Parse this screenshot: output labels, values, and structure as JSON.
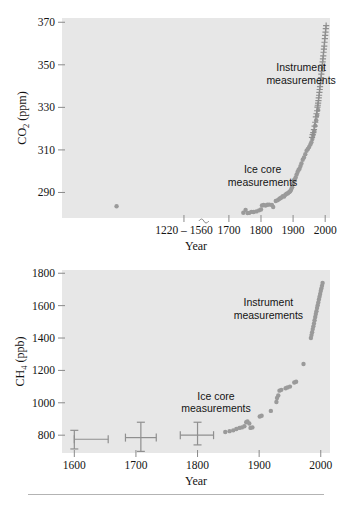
{
  "figure": {
    "background_color": "#ffffff",
    "plot_background_color": "#e7e7e7",
    "marker_color": "#9a9a9a",
    "axis_color": "#8a8a8a",
    "text_color": "#141414"
  },
  "chart_data": [
    {
      "id": "co2",
      "type": "scatter",
      "title": "",
      "xlabel": "Year",
      "ylabel": "CO2 (ppm)",
      "ylabel_parts": {
        "base": "CO",
        "sub": "2",
        "unit": "(ppm)"
      },
      "xlim": [
        1180,
        2015
      ],
      "ylim": [
        278,
        372
      ],
      "grid": false,
      "legend_position": "none",
      "x_ticks": [
        1560,
        1700,
        1800,
        1900,
        2000
      ],
      "x_tick_labels": [
        "1220 – 1560",
        "1700",
        "1800",
        "1900",
        "2000"
      ],
      "y_ticks": [
        290,
        310,
        330,
        350,
        370
      ],
      "y_tick_labels": [
        "290",
        "310",
        "330",
        "350",
        "370"
      ],
      "axis_break": {
        "present": true,
        "at_x": 1625,
        "label": "axis-break"
      },
      "annotations": [
        {
          "text": "Instrument measurements",
          "x": 1925,
          "y": 347,
          "lines": [
            "Instrument",
            "measurements"
          ]
        },
        {
          "text": "Ice core measurements",
          "x": 1805,
          "y": 299,
          "lines": [
            "Ice core",
            "measurements"
          ]
        }
      ],
      "series": [
        {
          "name": "Ice core measurements",
          "marker": "dot",
          "points": [
            [
              1350,
              283.5
            ],
            [
              1745,
              280.5
            ],
            [
              1752,
              281.8
            ],
            [
              1758,
              280.3
            ],
            [
              1763,
              280.4
            ],
            [
              1770,
              280.9
            ],
            [
              1777,
              280.8
            ],
            [
              1786,
              281.1
            ],
            [
              1794,
              281.6
            ],
            [
              1800,
              282.0
            ],
            [
              1803,
              283.9
            ],
            [
              1808,
              284.1
            ],
            [
              1814,
              283.9
            ],
            [
              1820,
              284.2
            ],
            [
              1826,
              284.3
            ],
            [
              1834,
              284.1
            ],
            [
              1838,
              283.2
            ],
            [
              1846,
              286.0
            ],
            [
              1852,
              286.4
            ],
            [
              1857,
              287.0
            ],
            [
              1860,
              287.3
            ],
            [
              1864,
              287.6
            ],
            [
              1868,
              288.3
            ],
            [
              1872,
              288.1
            ],
            [
              1876,
              288.9
            ],
            [
              1880,
              289.4
            ],
            [
              1884,
              289.6
            ],
            [
              1888,
              290.2
            ],
            [
              1891,
              290.6
            ],
            [
              1894,
              291.4
            ],
            [
              1897,
              292.4
            ],
            [
              1900,
              294.2
            ],
            [
              1902,
              295.6
            ],
            [
              1905,
              296.1
            ],
            [
              1908,
              297.0
            ],
            [
              1911,
              298.4
            ],
            [
              1914,
              299.6
            ],
            [
              1917,
              300.6
            ],
            [
              1920,
              301.2
            ],
            [
              1923,
              302.4
            ],
            [
              1926,
              303.6
            ],
            [
              1930,
              305.4
            ],
            [
              1934,
              306.4
            ],
            [
              1938,
              308.0
            ],
            [
              1942,
              309.6
            ],
            [
              1946,
              310.4
            ],
            [
              1950,
              311.4
            ],
            [
              1954,
              312.6
            ],
            [
              1957,
              313.6
            ],
            [
              1960,
              315.1
            ],
            [
              1963,
              317.0
            ],
            [
              1966,
              318.8
            ],
            [
              1969,
              321.4
            ],
            [
              1972,
              324.0
            ],
            [
              1975,
              326.2
            ],
            [
              1978,
              328.8
            ]
          ]
        },
        {
          "name": "Instrument measurements",
          "marker": "cross",
          "points": [
            [
              1959,
              315.9
            ],
            [
              1961,
              317.2
            ],
            [
              1963,
              318.1
            ],
            [
              1965,
              319.5
            ],
            [
              1967,
              321.2
            ],
            [
              1969,
              323.0
            ],
            [
              1971,
              325.5
            ],
            [
              1973,
              327.0
            ],
            [
              1975,
              328.4
            ],
            [
              1976,
              330.1
            ],
            [
              1977,
              331.0
            ],
            [
              1978,
              332.0
            ],
            [
              1979,
              333.2
            ],
            [
              1980,
              334.5
            ],
            [
              1981,
              335.7
            ],
            [
              1982,
              337.0
            ],
            [
              1983,
              338.4
            ],
            [
              1984,
              339.7
            ],
            [
              1985,
              341.2
            ],
            [
              1986,
              342.6
            ],
            [
              1987,
              344.0
            ],
            [
              1988,
              345.6
            ],
            [
              1989,
              347.0
            ],
            [
              1990,
              348.5
            ],
            [
              1991,
              350.0
            ],
            [
              1992,
              351.4
            ],
            [
              1993,
              352.8
            ],
            [
              1994,
              354.2
            ],
            [
              1995,
              355.9
            ],
            [
              1996,
              357.4
            ],
            [
              1997,
              358.8
            ],
            [
              1998,
              360.6
            ],
            [
              1999,
              362.3
            ],
            [
              2000,
              363.8
            ],
            [
              2001,
              365.4
            ],
            [
              2002,
              367.0
            ],
            [
              2003,
              368.4
            ]
          ]
        }
      ]
    },
    {
      "id": "ch4",
      "type": "scatter",
      "title": "",
      "xlabel": "Year",
      "ylabel": "CH4 (ppb)",
      "ylabel_parts": {
        "base": "CH",
        "sub": "4",
        "unit": "(ppb)"
      },
      "xlim": [
        1580,
        2015
      ],
      "ylim": [
        690,
        1820
      ],
      "grid": false,
      "legend_position": "none",
      "x_ticks": [
        1600,
        1700,
        1800,
        1900,
        2000
      ],
      "x_tick_labels": [
        "1600",
        "1700",
        "1800",
        "1900",
        "2000"
      ],
      "y_ticks": [
        800,
        1000,
        1200,
        1400,
        1600,
        1800
      ],
      "y_tick_labels": [
        "800",
        "1000",
        "1200",
        "1400",
        "1600",
        "1800"
      ],
      "annotations": [
        {
          "text": "Instrument measurements",
          "x": 1915,
          "y": 1595,
          "lines": [
            "Instrument",
            "measurements"
          ]
        },
        {
          "text": "Ice core measurements",
          "x": 1830,
          "y": 1020,
          "lines": [
            "Ice core",
            "measurements"
          ]
        }
      ],
      "error_bars": [
        {
          "x": 1600,
          "y": 775,
          "x_err_low": 1600,
          "x_err_high": 1655,
          "y_err_low": 715,
          "y_err_high": 830
        },
        {
          "x": 1708,
          "y": 785,
          "x_err_low": 1683,
          "x_err_high": 1733,
          "y_err_low": 700,
          "y_err_high": 880
        },
        {
          "x": 1800,
          "y": 800,
          "x_err_low": 1772,
          "x_err_high": 1826,
          "y_err_low": 740,
          "y_err_high": 880
        }
      ],
      "series": [
        {
          "name": "Ice core measurements",
          "marker": "dot",
          "points": [
            [
              1845,
              820
            ],
            [
              1852,
              825
            ],
            [
              1858,
              830
            ],
            [
              1863,
              838
            ],
            [
              1868,
              845
            ],
            [
              1872,
              848
            ],
            [
              1876,
              855
            ],
            [
              1879,
              880
            ],
            [
              1881,
              885
            ],
            [
              1884,
              872
            ],
            [
              1886,
              845
            ],
            [
              1889,
              848
            ],
            [
              1901,
              915
            ],
            [
              1904,
              920
            ],
            [
              1919,
              950
            ],
            [
              1928,
              1005
            ],
            [
              1929,
              1030
            ],
            [
              1931,
              1045
            ],
            [
              1933,
              1075
            ],
            [
              1936,
              1080
            ],
            [
              1943,
              1090
            ],
            [
              1946,
              1095
            ],
            [
              1950,
              1100
            ],
            [
              1957,
              1125
            ],
            [
              1960,
              1130
            ],
            [
              1972,
              1240
            ]
          ]
        },
        {
          "name": "Instrument measurements",
          "marker": "dot",
          "points": [
            [
              1984,
              1400
            ],
            [
              1985,
              1418
            ],
            [
              1986,
              1436
            ],
            [
              1987,
              1455
            ],
            [
              1988,
              1472
            ],
            [
              1989,
              1490
            ],
            [
              1990,
              1510
            ],
            [
              1991,
              1530
            ],
            [
              1992,
              1548
            ],
            [
              1993,
              1566
            ],
            [
              1994,
              1585
            ],
            [
              1995,
              1602
            ],
            [
              1996,
              1620
            ],
            [
              1997,
              1638
            ],
            [
              1998,
              1655
            ],
            [
              1999,
              1672
            ],
            [
              2000,
              1690
            ],
            [
              2001,
              1706
            ],
            [
              2002,
              1722
            ],
            [
              2003,
              1740
            ]
          ]
        }
      ]
    }
  ]
}
